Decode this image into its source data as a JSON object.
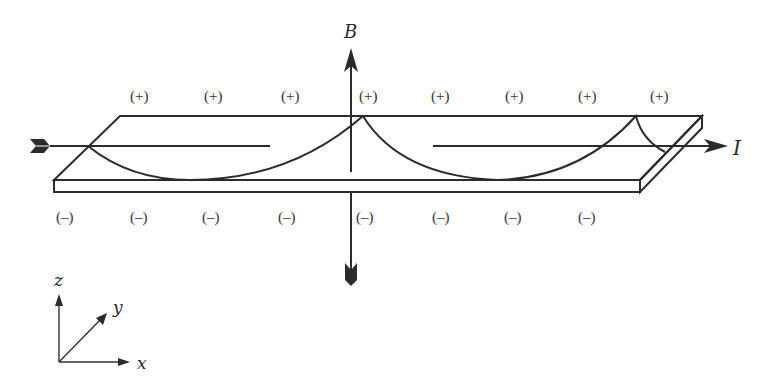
{
  "figure": {
    "labels": {
      "magnetic_field": "B",
      "current": "I",
      "axis_x": "x",
      "axis_y": "y",
      "axis_z": "z"
    },
    "top_charges": [
      "(+)",
      "(+)",
      "(+)",
      "(+)",
      "(+)",
      "(+)",
      "(+)",
      "(+)"
    ],
    "bottom_charges": [
      "(–)",
      "(–)",
      "(–)",
      "(–)",
      "(–)",
      "(–)",
      "(–)",
      "(–)"
    ],
    "colors": {
      "line": "#2b2b2b",
      "background": "#ffffff"
    }
  }
}
